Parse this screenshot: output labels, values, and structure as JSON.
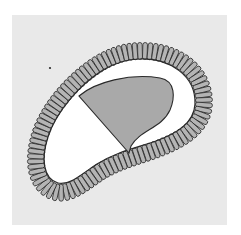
{
  "figure": {
    "colors": {
      "page": "#ffffff",
      "panel": "#e9e9e9",
      "cavity": "#ffffff",
      "inner_cell_mass": "#a9a9a9",
      "cell_fill": "#b4b4b4",
      "outline": "#2a2a2a"
    },
    "panel": {
      "x": 12,
      "y": 15,
      "width": 215,
      "height": 210
    },
    "ring": {
      "centerline_path": "M140,51 C175,50 205,70 204,104 C203,128 180,140 160,148 C140,156 120,160 100,172 C85,182 70,196 55,192 C35,186 32,160 40,135 C48,108 75,78 100,63 C112,56 125,51 140,51 Z",
      "inner_edge_path": "M140,59 C170,58 196,76 195,104 C194,124 175,134 156,141 C136,148 116,152 97,164 C84,172 70,186 58,183 C43,179 41,158 48,137 C56,112 80,84 103,70 C115,63 127,59 140,59 Z",
      "cell_count": 96,
      "cell_length": 17,
      "cell_width": 4.6
    },
    "inner_cell_mass": {
      "label": "inner-cell-mass",
      "path": "M79,96 C95,82 130,73 160,78 C176,81 175,98 170,110 C162,128 140,130 131,146 L129,153 Z"
    },
    "cavity": {
      "label": "blastocoel"
    },
    "marker_dot": {
      "cx": 50,
      "cy": 68,
      "r": 1.1
    }
  }
}
